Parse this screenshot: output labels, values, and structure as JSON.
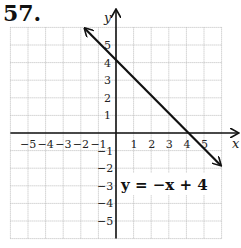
{
  "problem_number": "57.",
  "chart_data": {
    "type": "line",
    "title": "",
    "xlabel": "x",
    "ylabel": "y",
    "xlim": [
      -6,
      6
    ],
    "ylim": [
      -6,
      6
    ],
    "grid": true,
    "x_ticks": [
      "-5",
      "-4",
      "-3",
      "-2",
      "-1",
      "1",
      "2",
      "3",
      "4",
      "5"
    ],
    "y_ticks": [
      "5",
      "4",
      "3",
      "2",
      "1",
      "-1",
      "-2",
      "-3",
      "-4",
      "-5"
    ],
    "series": [
      {
        "name": "y = -x + 4",
        "x": [
          -2,
          6
        ],
        "y": [
          6,
          -2
        ],
        "arrows": "both"
      }
    ],
    "annotations": [
      {
        "text": "y = −x + 4",
        "x": 0.5,
        "y": -3.4
      }
    ]
  },
  "labels": {
    "x_axis": "x",
    "y_axis": "y",
    "equation": "y = −x + 4",
    "x_neg": [
      "−5",
      "−4",
      "−3",
      "−2",
      "−1"
    ],
    "x_pos": [
      "1",
      "2",
      "3",
      "4",
      "5"
    ],
    "y_pos": [
      "5",
      "4",
      "3",
      "2",
      "1"
    ],
    "y_neg": [
      "−1",
      "−2",
      "−3",
      "−4",
      "−5"
    ]
  }
}
